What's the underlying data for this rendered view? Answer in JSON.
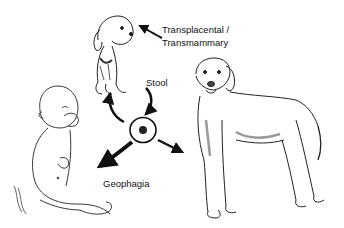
{
  "diagram": {
    "labels": {
      "transplacental": "Transplacental /",
      "transmammary": "Transmammary",
      "stool": "Stool",
      "geophagia": "Geophagia"
    },
    "nodes": [
      {
        "id": "puppy",
        "description": "Seated puppy (top center)"
      },
      {
        "id": "adult-dog",
        "description": "Standing adult dog (right)"
      },
      {
        "id": "child",
        "description": "Seated infant with hand to mouth (left)"
      },
      {
        "id": "egg",
        "description": "Egg with dark embryo (center)"
      }
    ],
    "edges": [
      {
        "from": "adult-dog",
        "to": "puppy",
        "label": "Transplacental / Transmammary"
      },
      {
        "from": "puppy",
        "to": "egg",
        "label": "Stool"
      },
      {
        "from": "egg",
        "to": "puppy",
        "label": ""
      },
      {
        "from": "egg",
        "to": "adult-dog",
        "label": ""
      },
      {
        "from": "egg",
        "to": "child",
        "label": "Geophagia"
      }
    ],
    "colors": {
      "ink": "#111111",
      "background": "#ffffff"
    }
  }
}
